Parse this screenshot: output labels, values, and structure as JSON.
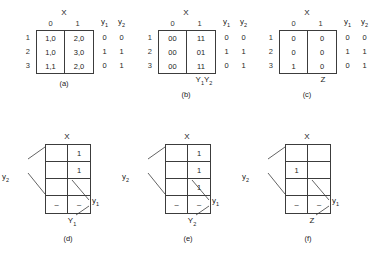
{
  "figure": {
    "title_vars": {
      "x": "X",
      "y1": "y",
      "y2": "y",
      "Y1": "Y",
      "Y2": "Y",
      "Z": "Z"
    },
    "flow_tables": [
      {
        "id": "a",
        "caption": "(a)",
        "col_header_label": "X",
        "col_headers": [
          "0",
          "1"
        ],
        "row_labels": [
          "1",
          "2",
          "3"
        ],
        "cells": [
          [
            "1,0",
            "2,0"
          ],
          [
            "1,0",
            "3,0"
          ],
          [
            "1,1",
            "2,0"
          ]
        ],
        "output_headers": [
          "y",
          "y"
        ],
        "output_header_subs": [
          "1",
          "2"
        ],
        "outputs": [
          [
            "0",
            "0"
          ],
          [
            "1",
            "1"
          ],
          [
            "0",
            "1"
          ]
        ],
        "foot_label": "",
        "foot_label_sub": ""
      },
      {
        "id": "b",
        "caption": "(b)",
        "col_header_label": "X",
        "col_headers": [
          "0",
          "1"
        ],
        "row_labels": [
          "1",
          "2",
          "3"
        ],
        "cells": [
          [
            "00",
            "11"
          ],
          [
            "00",
            "01"
          ],
          [
            "00",
            "11"
          ]
        ],
        "output_headers": [
          "y",
          "y"
        ],
        "output_header_subs": [
          "1",
          "2"
        ],
        "outputs": [
          [
            "0",
            "0"
          ],
          [
            "1",
            "1"
          ],
          [
            "0",
            "1"
          ]
        ],
        "foot_label": "Y",
        "foot_label_sub": "1",
        "foot_label2": "Y",
        "foot_label2_sub": "2"
      },
      {
        "id": "c",
        "caption": "(c)",
        "col_header_label": "X",
        "col_headers": [
          "0",
          "1"
        ],
        "row_labels": [
          "1",
          "2",
          "3"
        ],
        "cells": [
          [
            "0",
            "0"
          ],
          [
            "0",
            "0"
          ],
          [
            "1",
            "0"
          ]
        ],
        "output_headers": [
          "y",
          "y"
        ],
        "output_header_subs": [
          "1",
          "2"
        ],
        "outputs": [
          [
            "0",
            "0"
          ],
          [
            "1",
            "1"
          ],
          [
            "0",
            "1"
          ]
        ],
        "foot_label": "Z",
        "foot_label_sub": ""
      }
    ],
    "kmaps": [
      {
        "id": "d",
        "caption": "(d)",
        "top_label": "X",
        "left_label": "y",
        "left_label_sub": "2",
        "right_label": "y",
        "right_label_sub": "1",
        "foot_label": "Y",
        "foot_label_sub": "1",
        "cells": [
          [
            "",
            "1"
          ],
          [
            "",
            "1"
          ],
          [
            "",
            ""
          ],
          [
            "–",
            "–"
          ]
        ]
      },
      {
        "id": "e",
        "caption": "(e)",
        "top_label": "X",
        "left_label": "y",
        "left_label_sub": "2",
        "right_label": "y",
        "right_label_sub": "1",
        "foot_label": "Y",
        "foot_label_sub": "2",
        "cells": [
          [
            "",
            "1"
          ],
          [
            "",
            "1"
          ],
          [
            "",
            "1"
          ],
          [
            "–",
            "–"
          ]
        ]
      },
      {
        "id": "f",
        "caption": "(f)",
        "top_label": "X",
        "left_label": "y",
        "left_label_sub": "2",
        "right_label": "y",
        "right_label_sub": "1",
        "foot_label": "Z",
        "foot_label_sub": "",
        "cells": [
          [
            "",
            ""
          ],
          [
            "1",
            ""
          ],
          [
            "",
            ""
          ],
          [
            "–",
            "–"
          ]
        ]
      }
    ]
  },
  "colors": {
    "line": "#3c3c3c",
    "text": "#1a1a1a",
    "background": "#ffffff"
  }
}
